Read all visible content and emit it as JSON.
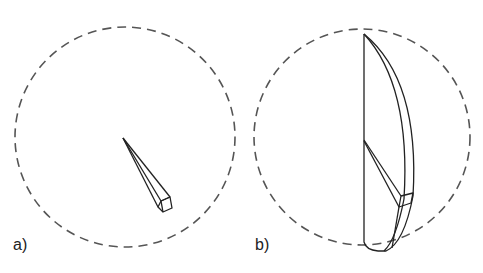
{
  "panels": [
    {
      "id": "a",
      "label": "a)",
      "description": "Dashed circle containing a thin tapered wedge (prism) pointing from the center toward the lower right"
    },
    {
      "id": "b",
      "label": "b)",
      "description": "Dashed circle containing a half-lens / crescent-shaped solid bounded by a vertical chord, with the wedge from panel a drawn inside"
    }
  ],
  "colors": {
    "stroke": "#222222",
    "dashed_circle": "#555555",
    "background": "#ffffff"
  }
}
